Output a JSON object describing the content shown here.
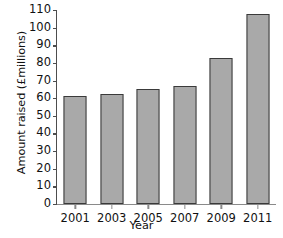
{
  "chart_data": {
    "type": "bar",
    "title": "",
    "xlabel": "Year",
    "ylabel": "Amount raised (£millions)",
    "categories": [
      "2001",
      "2003",
      "2005",
      "2007",
      "2009",
      "2011"
    ],
    "values": [
      61,
      62.5,
      65,
      67,
      83,
      108
    ],
    "series": [
      {
        "name": "Amount raised",
        "values": [
          61,
          62.5,
          65,
          67,
          83,
          108
        ]
      }
    ],
    "ylim": [
      0,
      110
    ],
    "yticks": [
      0,
      10,
      20,
      30,
      40,
      50,
      60,
      70,
      80,
      90,
      100,
      110
    ],
    "ytick_labels": [
      "0",
      "10",
      "20",
      "30",
      "40",
      "50",
      "60",
      "70",
      "80",
      "90",
      "100",
      "110"
    ],
    "xtick_labels": [
      "2001",
      "2003",
      "2005",
      "2007",
      "2009",
      "2011"
    ],
    "grid": false,
    "legend": null,
    "legend_position": "none",
    "bar_color": "#a9a9a9",
    "bar_edge_color": "#3a3a3a",
    "axis_color": "#4d4d4d",
    "background_color": "#ffffff",
    "annotations": []
  }
}
